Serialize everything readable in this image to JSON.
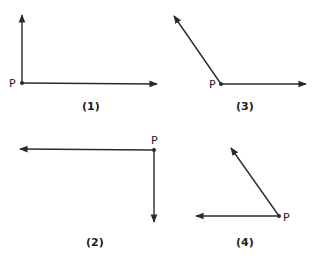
{
  "colors": {
    "ink": "#2a2a2a",
    "background": "#ffffff"
  },
  "point_label": "P",
  "diagrams": [
    {
      "caption": "(1)",
      "vertex": {
        "x": 22,
        "y": 83
      },
      "rays": [
        {
          "dir": "up",
          "end": {
            "x": 22,
            "y": 14
          }
        },
        {
          "dir": "right",
          "end": {
            "x": 158,
            "y": 84
          }
        }
      ],
      "angle": "90°"
    },
    {
      "caption": "(2)",
      "vertex": {
        "x": 154,
        "y": 150
      },
      "rays": [
        {
          "dir": "left",
          "end": {
            "x": 19,
            "y": 149
          }
        },
        {
          "dir": "down",
          "end": {
            "x": 154,
            "y": 223
          }
        }
      ],
      "angle": "90°"
    },
    {
      "caption": "(3)",
      "vertex": {
        "x": 221,
        "y": 84
      },
      "rays": [
        {
          "dir": "up-left",
          "end": {
            "x": 173,
            "y": 15
          }
        },
        {
          "dir": "right",
          "end": {
            "x": 307,
            "y": 84
          }
        }
      ],
      "angle": "obtuse"
    },
    {
      "caption": "(4)",
      "vertex": {
        "x": 279,
        "y": 216
      },
      "rays": [
        {
          "dir": "up-left",
          "end": {
            "x": 230,
            "y": 147
          }
        },
        {
          "dir": "left",
          "end": {
            "x": 195,
            "y": 216
          }
        }
      ],
      "angle": "acute"
    }
  ]
}
